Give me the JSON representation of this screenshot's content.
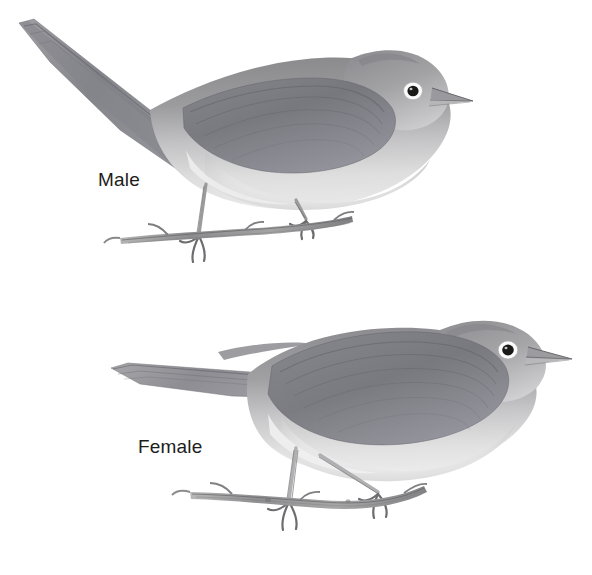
{
  "plate": {
    "title": "Bird plate: male and female warbler",
    "background_color": "#ffffff",
    "width": 592,
    "height": 575
  },
  "labels": {
    "male": "Male",
    "female": "Female",
    "text_color": "#1d1d1b",
    "font_size_px": 19
  },
  "palette": {
    "background": "#ffffff",
    "upperpart_gray": "#9a9a9c",
    "upperpart_gray_dark": "#76767a",
    "wing_dark": "#6d6d72",
    "underpart_light": "#e2e2e2",
    "underpart_mid": "#cfcfd1",
    "throat_white": "#f2f2f2",
    "eye_black": "#19191a",
    "eyering_white": "#fbfbfb",
    "bill_gray": "#8b8b8f",
    "leg_gray": "#b3b3b5",
    "branch_gray": "#9d9d9e",
    "branch_dark": "#6b6b6d",
    "outline": "#7c7c80"
  },
  "figures": [
    {
      "id": "male-bird",
      "label": "Male",
      "posture": "perched, body angled upward, tail raised to upper left",
      "bounding_box": {
        "x": 16,
        "y": 18,
        "width": 460,
        "height": 265
      },
      "parts": {
        "tail_tip": {
          "x": 18,
          "y": 24
        },
        "eye": {
          "x": 413,
          "y": 91,
          "radius": 5
        },
        "bill_tip": {
          "x": 473,
          "y": 101
        },
        "branch_left": {
          "x": 120,
          "y": 236
        },
        "branch_right": {
          "x": 352,
          "y": 218
        },
        "foot_front": {
          "x": 196,
          "y": 240
        },
        "foot_rear": {
          "x": 305,
          "y": 222
        }
      }
    },
    {
      "id": "female-bird",
      "label": "Female",
      "posture": "perched, body more horizontal, tail level to the left",
      "bounding_box": {
        "x": 105,
        "y": 328,
        "width": 470,
        "height": 235
      },
      "parts": {
        "tail_tip": {
          "x": 110,
          "y": 372
        },
        "eye": {
          "x": 508,
          "y": 350,
          "radius": 5
        },
        "bill_tip": {
          "x": 572,
          "y": 360
        },
        "branch_left": {
          "x": 190,
          "y": 496
        },
        "branch_right": {
          "x": 424,
          "y": 487
        },
        "foot_front": {
          "x": 288,
          "y": 510
        },
        "foot_rear": {
          "x": 378,
          "y": 500
        }
      }
    }
  ]
}
